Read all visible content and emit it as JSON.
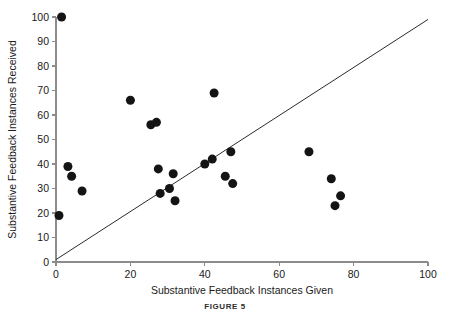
{
  "figure": {
    "caption": "FIGURE 5"
  },
  "chart_data": {
    "type": "scatter",
    "title": "",
    "xlabel": "Substantive Feedback Instances Given",
    "ylabel": "Substantive Feedback Instances Received",
    "xlim": [
      0,
      100
    ],
    "ylim": [
      0,
      100
    ],
    "xticks": [
      0,
      20,
      40,
      60,
      80,
      100
    ],
    "yticks": [
      0,
      10,
      20,
      30,
      40,
      50,
      60,
      70,
      80,
      90,
      100
    ],
    "grid": false,
    "legend": null,
    "marker": {
      "shape": "circle",
      "color": "#141414",
      "size_px": 9
    },
    "reference_line": {
      "label": "identity line y = x",
      "from": [
        0,
        1
      ],
      "to": [
        100,
        99
      ],
      "color": "#2b2b2b"
    },
    "points": [
      {
        "x": 1.5,
        "y": 100
      },
      {
        "x": 0.8,
        "y": 19
      },
      {
        "x": 3.2,
        "y": 39
      },
      {
        "x": 4.2,
        "y": 35
      },
      {
        "x": 7.0,
        "y": 29
      },
      {
        "x": 20.0,
        "y": 66
      },
      {
        "x": 25.5,
        "y": 56
      },
      {
        "x": 27.0,
        "y": 57
      },
      {
        "x": 27.5,
        "y": 38
      },
      {
        "x": 28.0,
        "y": 28
      },
      {
        "x": 30.5,
        "y": 30
      },
      {
        "x": 31.5,
        "y": 36
      },
      {
        "x": 32.0,
        "y": 25
      },
      {
        "x": 40.0,
        "y": 40
      },
      {
        "x": 42.0,
        "y": 42
      },
      {
        "x": 42.5,
        "y": 69
      },
      {
        "x": 45.5,
        "y": 35
      },
      {
        "x": 47.0,
        "y": 45
      },
      {
        "x": 47.5,
        "y": 32
      },
      {
        "x": 68.0,
        "y": 45
      },
      {
        "x": 74.0,
        "y": 34
      },
      {
        "x": 76.5,
        "y": 27
      },
      {
        "x": 75.0,
        "y": 23
      }
    ]
  }
}
